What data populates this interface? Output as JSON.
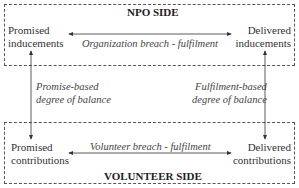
{
  "npo_side": {
    "title": "NPO SIDE",
    "promised": [
      "Promised",
      "inducements"
    ],
    "delivered": [
      "Delivered",
      "inducements"
    ],
    "horizontal_label": "Organization breach - fulfilment"
  },
  "volunteer_side": {
    "title": "VOLUNTEER SIDE",
    "promised": [
      "Promised",
      "contributions"
    ],
    "delivered": [
      "Delivered",
      "contributions"
    ],
    "horizontal_label": "Volunteer breach - fulfilment"
  },
  "vertical_labels": {
    "left": [
      "Promise-based",
      "degree of balance"
    ],
    "right": [
      "Fulfilment-based",
      "degree of balance"
    ]
  },
  "colors": {
    "line": "#333333",
    "border": "#555555",
    "text": "#333333"
  }
}
